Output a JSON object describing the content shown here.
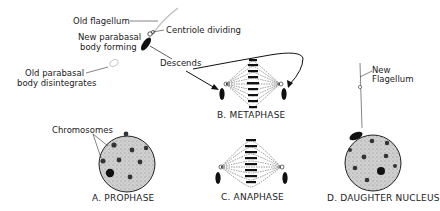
{
  "labels": {
    "old_flagellum": "Old flagellum",
    "centriole_dividing": "Centriole dividing",
    "new_parabasal_1": "New parabasal",
    "new_parabasal_2": "body forming",
    "old_parabasal_1": "Old parabasal",
    "old_parabasal_2": "body disintegrates",
    "descends": "Descends",
    "chromosomes": "Chromosomes",
    "new_flagellum_1": "New",
    "new_flagellum_2": "Flagellum"
  },
  "captions": {
    "a": "A.  PROPHASE",
    "b": "B.  METAPHASE",
    "c": "C.  ANAPHASE",
    "d": "D.  DAUGHTER  NUCLEUS"
  },
  "colors": {
    "ink": "#1a1a1a",
    "nucleus_fill": "#c9c9c9",
    "background": "#ffffff"
  }
}
